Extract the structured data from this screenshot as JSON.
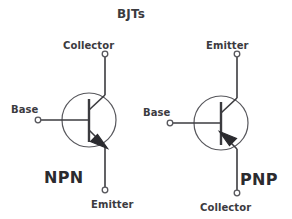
{
  "figure": {
    "title": "BJTs",
    "background_color": "#ffffff",
    "stroke_color": "#3b3b3f",
    "text_color": "#3b3b3f"
  },
  "devices": [
    {
      "id": "npn",
      "type_label": "NPN",
      "arrow_direction": "outward",
      "terminals": [
        {
          "name": "collector",
          "label": "Collector",
          "position": "top"
        },
        {
          "name": "base",
          "label": "Base",
          "position": "left"
        },
        {
          "name": "emitter",
          "label": "Emitter",
          "position": "bottom"
        }
      ]
    },
    {
      "id": "pnp",
      "type_label": "PNP",
      "arrow_direction": "inward",
      "terminals": [
        {
          "name": "emitter",
          "label": "Emitter",
          "position": "top"
        },
        {
          "name": "base",
          "label": "Base",
          "position": "left"
        },
        {
          "name": "collector",
          "label": "Collector",
          "position": "bottom"
        }
      ]
    }
  ]
}
